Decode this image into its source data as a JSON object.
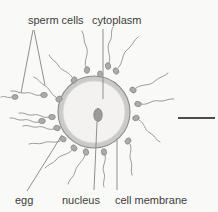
{
  "figure": {
    "labels": {
      "sperm_cells": "sperm cells",
      "cytoplasm": "cytoplasm",
      "egg": "egg",
      "nucleus": "nucleus",
      "cell_membrane": "cell membrane"
    },
    "colors": {
      "background": "#f9f9f7",
      "text": "#3d3d3d",
      "leader_line": "#8f8f8f",
      "egg_membrane": "#cacaca",
      "egg_outline": "#8c8c8c",
      "egg_interior": "#f3f2f1",
      "nucleus": "#9b9b9e",
      "nucleus_outline": "#7d7d80",
      "sperm": "#9b9b9b",
      "sperm_head": "#ababab",
      "sperm_head_outline": "#8a8a8a",
      "scale_bar": "#4c4c4c"
    }
  }
}
